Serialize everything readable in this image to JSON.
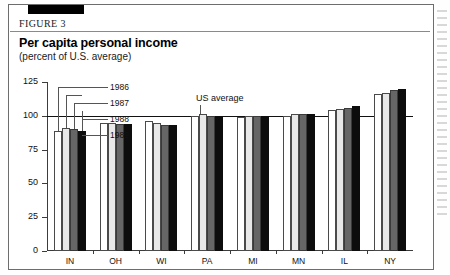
{
  "figure": {
    "label": "FIGURE 3",
    "title": "Per capita personal income",
    "subtitle": "(percent of U.S. average)"
  },
  "reference_line": {
    "label": "US average",
    "value": 100
  },
  "legend": {
    "items": [
      {
        "year": "1986",
        "swatch": "white"
      },
      {
        "year": "1987",
        "swatch": "light-gray"
      },
      {
        "year": "1988",
        "swatch": "dark-gray"
      },
      {
        "year": "1989",
        "swatch": "black"
      }
    ]
  },
  "colors": {
    "y1986": "#ffffff",
    "y1987": "#e8e8e8",
    "y1988": "#666666",
    "y1989": "#0d0d0d",
    "axis": "#3c3c3c",
    "reference": "#111111"
  },
  "chart_data": {
    "type": "bar",
    "title": "Per capita personal income",
    "subtitle": "(percent of U.S. average)",
    "xlabel": "",
    "ylabel": "",
    "ylim": [
      0,
      125
    ],
    "yticks": [
      0,
      25,
      50,
      75,
      100,
      125
    ],
    "grid": false,
    "legend_position": "inside-top-left",
    "reference_lines": [
      {
        "y": 100,
        "label": "US average"
      }
    ],
    "categories": [
      "IN",
      "OH",
      "WI",
      "PA",
      "MI",
      "MN",
      "IL",
      "NY"
    ],
    "series": [
      {
        "name": "1986",
        "values": [
          89,
          95,
          96,
          100,
          99,
          100,
          104,
          116
        ]
      },
      {
        "name": "1987",
        "values": [
          91,
          95,
          95,
          101,
          100,
          101,
          105,
          117
        ]
      },
      {
        "name": "1988",
        "values": [
          90,
          94,
          93,
          100,
          100,
          101,
          106,
          119
        ]
      },
      {
        "name": "1989",
        "values": [
          89,
          94,
          93,
          100,
          100,
          101,
          107,
          120
        ]
      }
    ]
  }
}
